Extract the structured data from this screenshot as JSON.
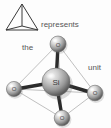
{
  "figure": {
    "background_color": "#fdfdfd",
    "text_color": "#555555"
  },
  "icon": {
    "name": "tetrahedron-wireframe-icon",
    "description": "line drawing of a tetrahedron",
    "stroke_color": "#3a3a3a"
  },
  "labels": {
    "represents": "represents",
    "the": "the",
    "unit": "unit"
  },
  "model": {
    "type": "ball-and-stick",
    "central_atom": {
      "symbol": "Si",
      "name": "silicon",
      "color": "#9a9a9a"
    },
    "outer_atoms": [
      {
        "symbol": "O",
        "name": "oxygen-top",
        "color": "#a8a8a8"
      },
      {
        "symbol": "O",
        "name": "oxygen-left",
        "color": "#a8a8a8"
      },
      {
        "symbol": "O",
        "name": "oxygen-right",
        "color": "#a8a8a8"
      },
      {
        "symbol": "O",
        "name": "oxygen-bottom",
        "color": "#a8a8a8"
      }
    ],
    "bond_color": "#2e2e2e",
    "edge_color": "#9b9b9b",
    "bond_count": 4
  }
}
